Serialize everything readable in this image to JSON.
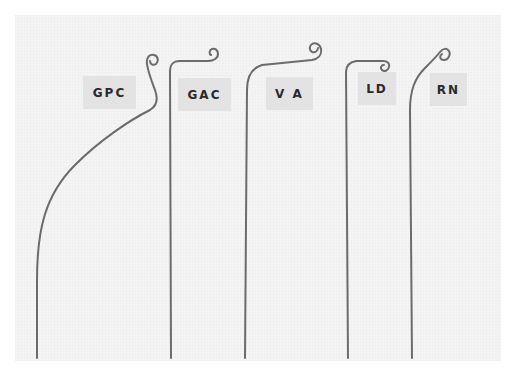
{
  "scene": {
    "description": "Photograph of five curved catheter/guidewire tips on light paper, each labeled",
    "background_color": "#ffffff",
    "paper_color": "#f4f4f4",
    "label_color": "#e3e3e3",
    "wire_color": "#6a6a6a"
  },
  "catheters": [
    {
      "id": "gpc",
      "label": "GPC"
    },
    {
      "id": "gac",
      "label": "GAC"
    },
    {
      "id": "va",
      "label": "V A"
    },
    {
      "id": "ld",
      "label": "LD"
    },
    {
      "id": "rn",
      "label": "RN"
    }
  ]
}
